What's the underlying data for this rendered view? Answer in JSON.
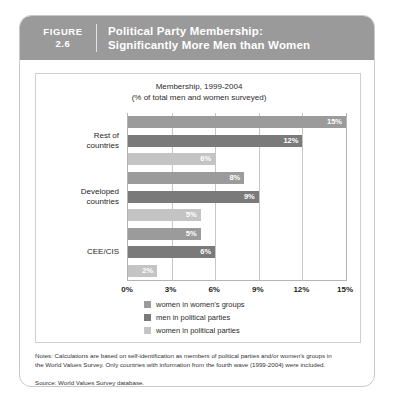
{
  "figure": {
    "label_word": "FIGURE",
    "number": "2.6",
    "title_line1": "Political Party Membership:",
    "title_line2": "Significantly More Men than Women"
  },
  "chart_data": {
    "type": "bar",
    "orientation": "horizontal",
    "title": "Membership, 1999-2004",
    "subtitle": "(% of total men and women surveyed)",
    "xlabel": "",
    "ylabel": "",
    "xlim": [
      0,
      15
    ],
    "xticks": [
      "0%",
      "3%",
      "6%",
      "9%",
      "12%",
      "15%"
    ],
    "xtick_values": [
      0,
      3,
      6,
      9,
      12,
      15
    ],
    "grid": true,
    "legend_position": "bottom",
    "categories": [
      "Rest of countries",
      "Developed countries",
      "CEE/CIS"
    ],
    "series": [
      {
        "name": "women in women's groups",
        "color": "#9b9b9b",
        "values": [
          15,
          8,
          5
        ]
      },
      {
        "name": "men in political parties",
        "color": "#7a7a7a",
        "values": [
          12,
          9,
          6
        ]
      },
      {
        "name": "women in political parties",
        "color": "#c4c4c4",
        "values": [
          6,
          5,
          2
        ]
      }
    ],
    "bars": [
      {
        "group": "Rest of countries",
        "series": "women in women's groups",
        "value": 15,
        "label": "15%",
        "color": "#9b9b9b"
      },
      {
        "group": "Rest of countries",
        "series": "men in political parties",
        "value": 12,
        "label": "12%",
        "color": "#7a7a7a"
      },
      {
        "group": "Rest of countries",
        "series": "women in political parties",
        "value": 6,
        "label": "6%",
        "color": "#c4c4c4"
      },
      {
        "group": "Developed countries",
        "series": "women in women's groups",
        "value": 8,
        "label": "8%",
        "color": "#9b9b9b"
      },
      {
        "group": "Developed countries",
        "series": "men in political parties",
        "value": 9,
        "label": "9%",
        "color": "#7a7a7a"
      },
      {
        "group": "Developed countries",
        "series": "women in political parties",
        "value": 5,
        "label": "5%",
        "color": "#c4c4c4"
      },
      {
        "group": "CEE/CIS",
        "series": "women in women's groups",
        "value": 5,
        "label": "5%",
        "color": "#9b9b9b"
      },
      {
        "group": "CEE/CIS",
        "series": "men in political parties",
        "value": 6,
        "label": "6%",
        "color": "#7a7a7a"
      },
      {
        "group": "CEE/CIS",
        "series": "women in political parties",
        "value": 2,
        "label": "2%",
        "color": "#c4c4c4"
      }
    ],
    "category_labels": [
      {
        "line1": "Rest of",
        "line2": "countries"
      },
      {
        "line1": "Developed",
        "line2": "countries"
      },
      {
        "line1": "CEE/CIS",
        "line2": ""
      }
    ],
    "legend": [
      {
        "label": "women in women's groups",
        "color": "#9b9b9b"
      },
      {
        "label": "men in political parties",
        "color": "#7a7a7a"
      },
      {
        "label": "women in political parties",
        "color": "#c4c4c4"
      }
    ]
  },
  "notes": {
    "line1": "Notes: Calculations are based on self-identification as members of political parties and/or women's groups in",
    "line2": "the World Values Survey. Only countries with information from the fourth wave (1999-2004) were included.",
    "source": "Source: World Values Survey database."
  },
  "colors": {
    "header_band": "#9a9a9a",
    "series_medium": "#9b9b9b",
    "series_dark": "#7a7a7a",
    "series_light": "#c4c4c4",
    "card_border": "#c9c9c9"
  }
}
